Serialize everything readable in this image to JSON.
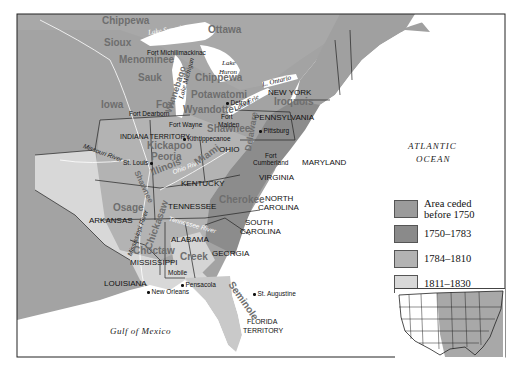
{
  "map": {
    "colors": {
      "before_1750": "#9a9a9a",
      "1750_1783": "#8c8c8c",
      "1784_1810": "#b4b4b4",
      "1811_1830": "#d9d9d9",
      "uncolored_land": "#a6a6a6",
      "water": "#ffffff",
      "border": "#222222"
    },
    "water_labels": {
      "lake_superior": "Lake Superior",
      "lake_michigan": "Lake Michigan",
      "lake_huron_1": "Lake",
      "lake_huron_2": "Huron",
      "lake_erie": "Lake Erie",
      "lake_ontario": "L. Ontario",
      "atlantic_1": "ATLANTIC",
      "atlantic_2": "OCEAN",
      "gulf": "Gulf of Mexico"
    },
    "rivers": {
      "missouri": "Missouri River",
      "ohio": "Ohio River",
      "mississippi": "Mississippi River",
      "tennessee": "Tennessee River"
    },
    "states": {
      "new_york": "NEW YORK",
      "pennsylvania": "PENNSYLVANIA",
      "maryland": "MARYLAND",
      "virginia": "VIRGINIA",
      "ohio": "OHIO",
      "indiana_territory": "INDIANA TERRITORY",
      "kentucky": "KENTUCKY",
      "tennessee": "TENNESSEE",
      "north_carolina_1": "NORTH",
      "north_carolina_2": "CAROLINA",
      "south_carolina_1": "SOUTH",
      "south_carolina_2": "CAROLINA",
      "georgia": "GEORGIA",
      "alabama": "ALABAMA",
      "mississippi": "MISSISSIPPI",
      "louisiana": "LOUISIANA",
      "arkansas": "ARKANSAS",
      "florida_1": "FLORIDA",
      "florida_2": "TERRITORY"
    },
    "tribes": {
      "chippewa_n": "Chippewa",
      "ottawa": "Ottawa",
      "sioux": "Sioux",
      "menominee": "Menominee",
      "sauk": "Sauk",
      "chippewa_mi": "Chippewa",
      "winnebago": "Winnebago",
      "potawatomi": "Potawatomi",
      "iowa": "Iowa",
      "fox": "Fox",
      "wyandotte": "Wyandotte",
      "iroquois": "Iroquois",
      "shawnee_oh": "Shawnee",
      "delaware": "Delaware",
      "kickapoo": "Kickapoo",
      "peoria": "Peoria",
      "illinois": "Illinois",
      "miami": "Miami",
      "shawnee_w": "Shawnee",
      "osage": "Osage",
      "cherokee": "Cherokee",
      "chickasaw": "Chickasaw",
      "choctaw": "Choctaw",
      "creek": "Creek",
      "seminole": "Seminole"
    },
    "places": {
      "fort_michilimackinac": "Fort Michilimackinac",
      "detroit": "Detroit",
      "fort_dearborn": "Fort Dearborn",
      "fort_wayne": "Fort Wayne",
      "fort_malden_1": "Fort",
      "fort_malden_2": "Malden",
      "kithtippecanoe": "Kithtippecanoe",
      "st_louis": "St. Louis",
      "pittsburg": "Pittsburg",
      "fort_cumberland_1": "Fort",
      "fort_cumberland_2": "Cumberland",
      "mobile": "Mobile",
      "pensacola": "Pensacola",
      "new_orleans": "New Orleans",
      "st_augustine": "St. Augustine"
    }
  },
  "legend": {
    "items": [
      {
        "label_1": "Area ceded",
        "label_2": "before 1750",
        "color": "#9b9b9b"
      },
      {
        "label_1": "1750–1783",
        "label_2": "",
        "color": "#8a8a8a"
      },
      {
        "label_1": "1784–1810",
        "label_2": "",
        "color": "#b3b3b3"
      },
      {
        "label_1": "1811–1830",
        "label_2": "",
        "color": "#d8d8d8"
      }
    ]
  },
  "inset": {
    "description": "Locator map of contiguous United States with eastern portion shaded"
  }
}
